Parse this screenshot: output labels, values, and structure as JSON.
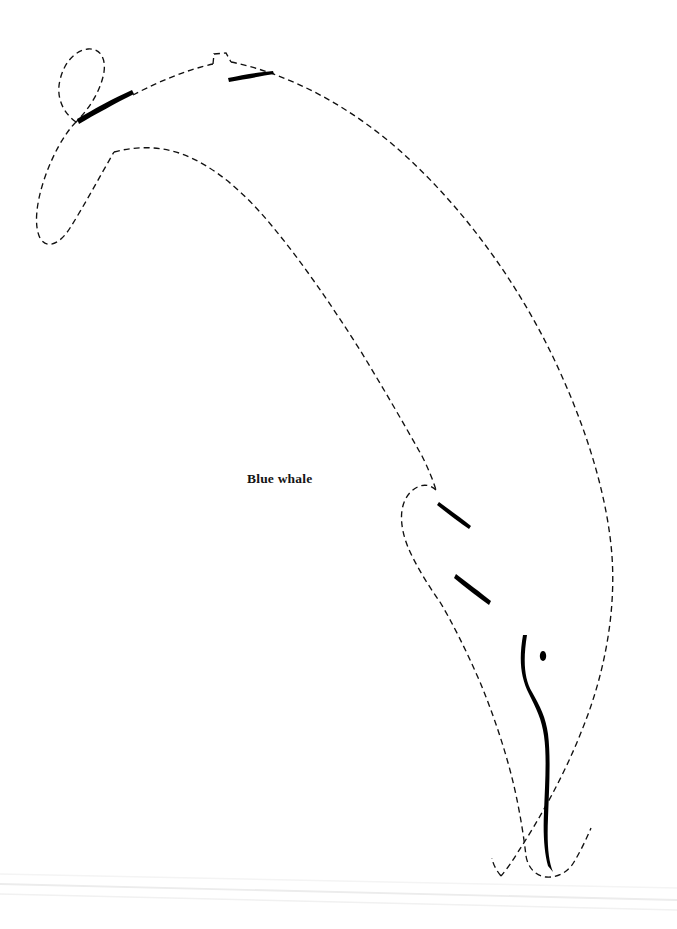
{
  "figure": {
    "title": "Blue whale",
    "kind": "line-drawing",
    "subject": "blue whale",
    "orientation": "tail upper-left, head lower-right, body arched in a dive",
    "page": {
      "width": 677,
      "height": 929,
      "background_color": "#ffffff"
    },
    "label": {
      "text": "Blue whale",
      "x": 247,
      "y": 471,
      "font_size_px": 13.5,
      "font_weight": "bold",
      "font_style": "serif",
      "color": "#141414"
    },
    "ink": {
      "outline_color": "#111111",
      "outline_width_px": 1.35,
      "outline_style": "dashed",
      "dash_pattern": "6 4",
      "solid_color": "#000000"
    },
    "parts": [
      {
        "name": "tail-fluke-upper-lobe",
        "style": "dashed",
        "description": "upper tail lobe sweeping up and left from the tail notch"
      },
      {
        "name": "tail-fluke-lower-lobe",
        "style": "dashed",
        "description": "lower tail lobe extending down-left to a rounded tip"
      },
      {
        "name": "tail-stock-stroke",
        "style": "solid",
        "description": "thick tapered stroke along the tail stock",
        "from": [
          80,
          120
        ],
        "to": [
          133,
          95
        ]
      },
      {
        "name": "dorsal-fin",
        "style": "dashed",
        "description": "small angular dorsal fin notch on the back line",
        "apex": [
          215,
          62
        ]
      },
      {
        "name": "dorsal-fin-stroke",
        "style": "solid",
        "description": "thin tapered stroke below the dorsal fin",
        "from": [
          228,
          80
        ],
        "to": [
          272,
          74
        ]
      },
      {
        "name": "back-contour",
        "style": "dashed",
        "description": "long dashed curve from dorsal fin around the back to the head"
      },
      {
        "name": "belly-contour",
        "style": "dashed",
        "description": "long dashed curve along the underside toward the flipper"
      },
      {
        "name": "pectoral-flipper",
        "style": "dashed",
        "description": "hooked flipper outline on the lower body"
      },
      {
        "name": "flipper-stroke-upper",
        "style": "solid",
        "from": [
          440,
          503
        ],
        "to": [
          470,
          524
        ]
      },
      {
        "name": "flipper-stroke-lower",
        "style": "solid",
        "from": [
          457,
          575
        ],
        "to": [
          490,
          600
        ]
      },
      {
        "name": "mouth-line",
        "style": "solid",
        "description": "long solid S-curve of the jawline running to the snout tip",
        "from": [
          527,
          635
        ],
        "to": [
          552,
          872
        ]
      },
      {
        "name": "eye",
        "style": "solid-filled",
        "shape": "small vertical ellipse",
        "center": [
          543,
          656
        ],
        "radius_x": 3.2,
        "radius_y": 5.0
      },
      {
        "name": "snout-tip",
        "style": "dashed",
        "description": "rounded tip of the rostrum at the bottom of the figure"
      }
    ],
    "scan_artifacts": [
      {
        "name": "scan-hairline-1",
        "from": [
          0,
          884
        ],
        "to": [
          677,
          900
        ],
        "color": "#ececec"
      },
      {
        "name": "scan-hairline-2",
        "from": [
          0,
          894
        ],
        "to": [
          677,
          910
        ],
        "color": "#f0f0f0"
      },
      {
        "name": "scan-hairline-3",
        "from": [
          0,
          874
        ],
        "to": [
          677,
          888
        ],
        "color": "#f4f4f4"
      }
    ]
  }
}
